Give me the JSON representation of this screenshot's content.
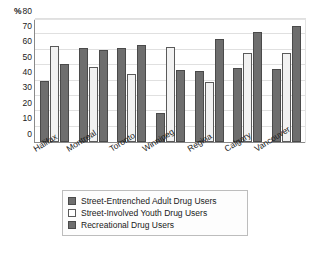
{
  "chart_data": {
    "type": "bar",
    "title": "",
    "subtitle": "",
    "xlabel": "",
    "ylabel": "%",
    "ylim": [
      0,
      80
    ],
    "yticks": [
      0,
      10,
      20,
      30,
      40,
      50,
      60,
      70,
      80
    ],
    "ytick_labels": [
      "0",
      "10",
      "20",
      "30",
      "40",
      "50",
      "60",
      "70",
      "80"
    ],
    "grid": "horizontal",
    "legend_position": "bottom",
    "categories": [
      "Halifax",
      "Montreal",
      "Toronto",
      "Winnipeg",
      "Regina",
      "Calgary",
      "Vancouver"
    ],
    "series": [
      {
        "name": "Street-Entrenched Adult Drug Users",
        "color": "#6e6e6e",
        "values": [
          40,
          61,
          61,
          19,
          46,
          48,
          47.5
        ]
      },
      {
        "name": "Street-Involved Youth Drug Users",
        "color": "#ffffff",
        "values": [
          62.5,
          48.5,
          44.5,
          62,
          39,
          58,
          58
        ]
      },
      {
        "name": "Recreational Drug Users",
        "color": "#6e6e6e",
        "values": [
          51,
          60,
          63,
          47,
          67,
          71.5,
          75.5
        ]
      }
    ]
  },
  "axis": {
    "unit_label": "%"
  },
  "legend": {
    "entries": [
      "Street-Entrenched Adult Drug Users",
      "Street-Involved Youth Drug Users",
      "Recreational Drug Users"
    ]
  }
}
